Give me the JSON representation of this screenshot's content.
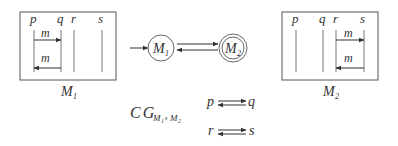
{
  "machine_m1": {
    "label": "M",
    "label_sub": "1",
    "lanes": [
      "p",
      "q",
      "r",
      "s"
    ],
    "messages": [
      {
        "label": "m",
        "from": "p",
        "to": "q"
      },
      {
        "label": "m",
        "from": "q",
        "to": "p"
      }
    ]
  },
  "machine_m2": {
    "label": "M",
    "label_sub": "2",
    "lanes": [
      "p",
      "q",
      "r",
      "s"
    ],
    "messages": [
      {
        "label": "m",
        "from": "r",
        "to": "s"
      },
      {
        "label": "m",
        "from": "s",
        "to": "r"
      }
    ]
  },
  "automaton": {
    "states": [
      {
        "label": "M",
        "sub": "1",
        "initial": true,
        "accepting": false
      },
      {
        "label": "M",
        "sub": "2",
        "initial": false,
        "accepting": true
      }
    ]
  },
  "communication_graph": {
    "label": "CG",
    "subscript": "M",
    "sub_1": "1",
    "op": "∘",
    "sub_2": "M",
    "sub_3": "2",
    "edges": [
      {
        "from": "p",
        "to": "q"
      },
      {
        "from": "r",
        "to": "s"
      }
    ]
  }
}
